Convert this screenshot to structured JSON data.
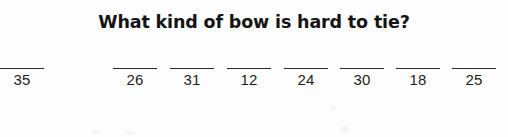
{
  "worksheet": {
    "title": "What kind of bow is hard to tie?",
    "ink_color": "#1d1d1d",
    "background_color": "#fdfdfd",
    "blanks": [
      {
        "number": "35",
        "left": 0,
        "width": 44
      },
      {
        "number": "26",
        "left": 113,
        "width": 44
      },
      {
        "number": "31",
        "left": 170,
        "width": 44
      },
      {
        "number": "12",
        "left": 227,
        "width": 44
      },
      {
        "number": "24",
        "left": 284,
        "width": 44
      },
      {
        "number": "30",
        "left": 340,
        "width": 44
      },
      {
        "number": "18",
        "left": 396,
        "width": 44
      },
      {
        "number": "25",
        "left": 452,
        "width": 44
      }
    ]
  }
}
